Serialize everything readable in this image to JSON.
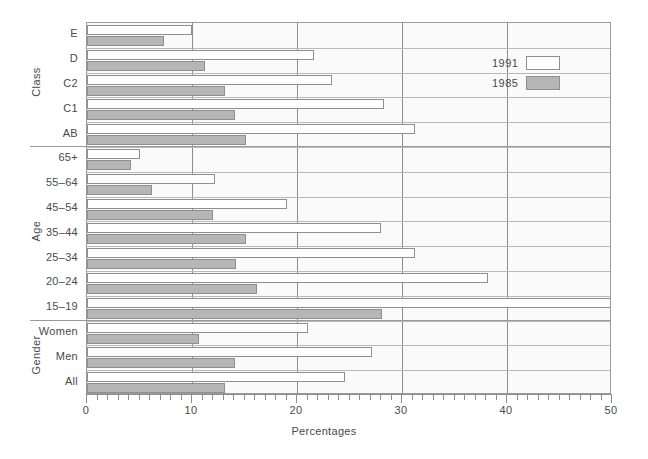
{
  "chart_data": {
    "type": "bar",
    "orientation": "horizontal",
    "title": "",
    "xlabel": "Percentages",
    "ylabel": "",
    "xlim": [
      0,
      50
    ],
    "xticks": [
      0,
      10,
      20,
      30,
      40,
      50
    ],
    "xtick_labels": [
      "0",
      "10",
      "20",
      "30",
      "40",
      "50"
    ],
    "minor_tick_step": 1,
    "grid": "vertical-major",
    "legend": {
      "position": "upper-right-inside",
      "entries": [
        {
          "name": "1991",
          "color": "#ffffff",
          "swatch": "white"
        },
        {
          "name": "1985",
          "color": "#b6b6b6",
          "swatch": "gray"
        }
      ]
    },
    "groups": [
      {
        "label": "Class",
        "categories": [
          "E",
          "D",
          "C2",
          "C1",
          "AB"
        ],
        "series": [
          {
            "name": "1991",
            "values": [
              10.0,
              21.6,
              23.3,
              28.3,
              31.2
            ]
          },
          {
            "name": "1985",
            "values": [
              7.3,
              11.2,
              13.1,
              14.1,
              15.1
            ]
          }
        ]
      },
      {
        "label": "Age",
        "categories": [
          "65+",
          "55–64",
          "45–54",
          "35–44",
          "25–34",
          "20–24",
          "15–19"
        ],
        "series": [
          {
            "name": "1991",
            "values": [
              5.0,
              12.2,
              19.0,
              28.0,
              31.2,
              38.2,
              50.0
            ]
          },
          {
            "name": "1985",
            "values": [
              4.2,
              6.2,
              12.0,
              15.1,
              14.2,
              16.2,
              28.1
            ]
          }
        ]
      },
      {
        "label": "Gender",
        "categories": [
          "Women",
          "Men",
          "All"
        ],
        "series": [
          {
            "name": "1991",
            "values": [
              21.0,
              27.1,
              24.6
            ]
          },
          {
            "name": "1985",
            "values": [
              10.7,
              14.1,
              13.1
            ]
          }
        ]
      }
    ]
  },
  "colors": {
    "bar_1991": "#ffffff",
    "bar_1985": "#b6b6b6",
    "bar_outline": "#8e8e8e",
    "plot_background": "#fafafa",
    "gridline": "#8d8d8d",
    "axis": "#8d8d8d",
    "text": "#4a4a4a"
  }
}
